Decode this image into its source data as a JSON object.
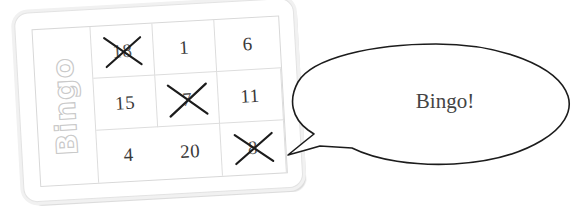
{
  "scene": {
    "background_color": "#ffffff",
    "description_name": "bingo-card-with-speech-bubble"
  },
  "card": {
    "label": "Bingo",
    "label_color": "#c9c9c9",
    "border_color": "#e3e3e3",
    "shadow_color": "#dcdcdc",
    "rotation_degrees": -3.2,
    "grid": {
      "columns": 3,
      "rows": 3,
      "cells": [
        {
          "value": "18",
          "marked": true
        },
        {
          "value": "1",
          "marked": false
        },
        {
          "value": "6",
          "marked": false
        },
        {
          "value": "15",
          "marked": false
        },
        {
          "value": "7",
          "marked": true
        },
        {
          "value": "11",
          "marked": false
        },
        {
          "value": "4",
          "marked": false
        },
        {
          "value": "20",
          "marked": false
        },
        {
          "value": "8",
          "marked": true
        }
      ]
    },
    "mark_icon_name": "x-cross-mark",
    "mark_color": "#1c1c1c"
  },
  "speech_bubble": {
    "text": "Bingo!",
    "text_color": "#444444",
    "outline_color": "#1c1c1c",
    "fill_color": "#ffffff",
    "tail_direction": "left"
  }
}
